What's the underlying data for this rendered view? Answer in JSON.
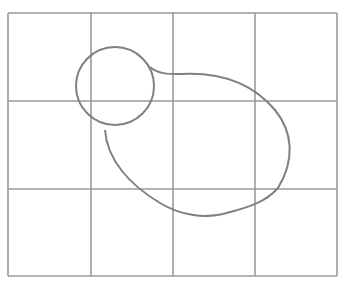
{
  "figure": {
    "grid": {
      "columns": 4,
      "rows": 3,
      "x": [
        8,
        91,
        173,
        255,
        337
      ],
      "y": [
        13,
        101,
        189,
        276
      ],
      "color": "#9a9a9a"
    },
    "circle": {
      "cx": 115,
      "cy": 86,
      "r": 39,
      "color": "#808080"
    },
    "blob": {
      "path": "M 150 67 C 158 74, 168 74, 180 74 C 215 72, 250 80, 275 110 C 293 132, 295 160, 278 188 C 265 203, 245 208, 230 212 C 205 220, 180 215, 160 203 C 130 185, 107 160, 105 130",
      "color": "#808080"
    }
  }
}
